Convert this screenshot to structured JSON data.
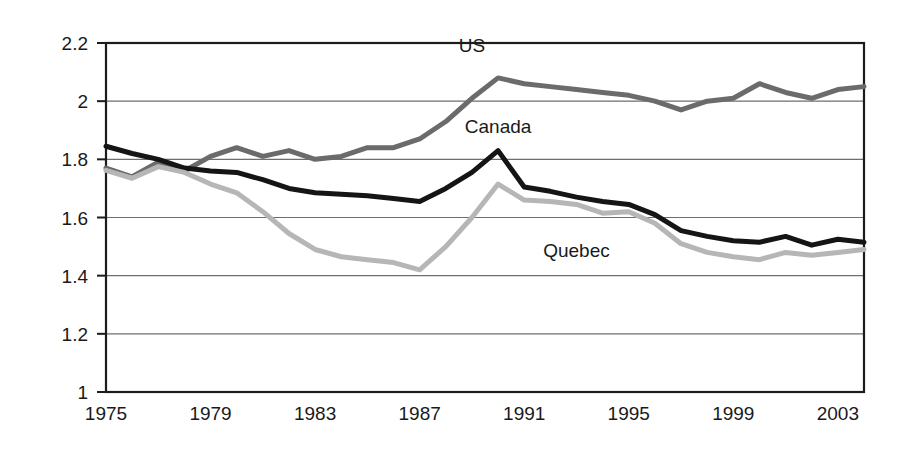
{
  "chart_data": {
    "type": "line",
    "title": "",
    "subtitle": "",
    "xlabel": "",
    "ylabel": "",
    "xlim": [
      1975,
      2004
    ],
    "ylim": [
      1,
      2.2
    ],
    "grid": true,
    "legend_position": "inline-annotations",
    "y_ticks": [
      "1",
      "1.2",
      "1.4",
      "1.6",
      "1.8",
      "2",
      "2.2"
    ],
    "y_tick_values": [
      1,
      1.2,
      1.4,
      1.6,
      1.8,
      2,
      2.2
    ],
    "x_ticks": [
      "1975",
      "1979",
      "1983",
      "1987",
      "1991",
      "1995",
      "1999",
      "2003"
    ],
    "x_tick_values": [
      1975,
      1979,
      1983,
      1987,
      1991,
      1995,
      1999,
      2003
    ],
    "x": [
      1975,
      1976,
      1977,
      1978,
      1979,
      1980,
      1981,
      1982,
      1983,
      1984,
      1985,
      1986,
      1987,
      1988,
      1989,
      1990,
      1991,
      1992,
      1993,
      1994,
      1995,
      1996,
      1997,
      1998,
      1999,
      2000,
      2001,
      2002,
      2003,
      2004
    ],
    "series": [
      {
        "name": "US",
        "color": "#6b6b6b",
        "width": 5,
        "label_x": 1989,
        "label_y": 2.17,
        "values": [
          1.77,
          1.74,
          1.79,
          1.76,
          1.81,
          1.84,
          1.81,
          1.83,
          1.8,
          1.81,
          1.84,
          1.84,
          1.87,
          1.93,
          2.01,
          2.08,
          2.06,
          2.05,
          2.04,
          2.03,
          2.02,
          2.0,
          1.97,
          2.0,
          2.01,
          2.06,
          2.03,
          2.01,
          2.04,
          2.05
        ]
      },
      {
        "name": "Canada",
        "color": "#151515",
        "width": 5,
        "label_x": 1990,
        "label_y": 1.89,
        "values": [
          1.845,
          1.82,
          1.8,
          1.77,
          1.76,
          1.755,
          1.73,
          1.7,
          1.685,
          1.68,
          1.675,
          1.665,
          1.655,
          1.7,
          1.755,
          1.83,
          1.705,
          1.69,
          1.67,
          1.655,
          1.645,
          1.61,
          1.555,
          1.535,
          1.52,
          1.515,
          1.535,
          1.505,
          1.525,
          1.515
        ]
      },
      {
        "name": "Quebec",
        "color": "#b6b6b6",
        "width": 5,
        "label_x": 1993,
        "label_y": 1.465,
        "values": [
          1.762,
          1.735,
          1.775,
          1.755,
          1.715,
          1.685,
          1.62,
          1.545,
          1.49,
          1.465,
          1.455,
          1.445,
          1.42,
          1.5,
          1.6,
          1.715,
          1.66,
          1.655,
          1.645,
          1.615,
          1.62,
          1.58,
          1.51,
          1.48,
          1.465,
          1.455,
          1.48,
          1.47,
          1.48,
          1.49
        ]
      }
    ]
  },
  "plot": {
    "left_px": 106,
    "right_px": 864,
    "top_px": 43,
    "bottom_px": 392,
    "year_min": 1975,
    "year_max": 2004
  }
}
